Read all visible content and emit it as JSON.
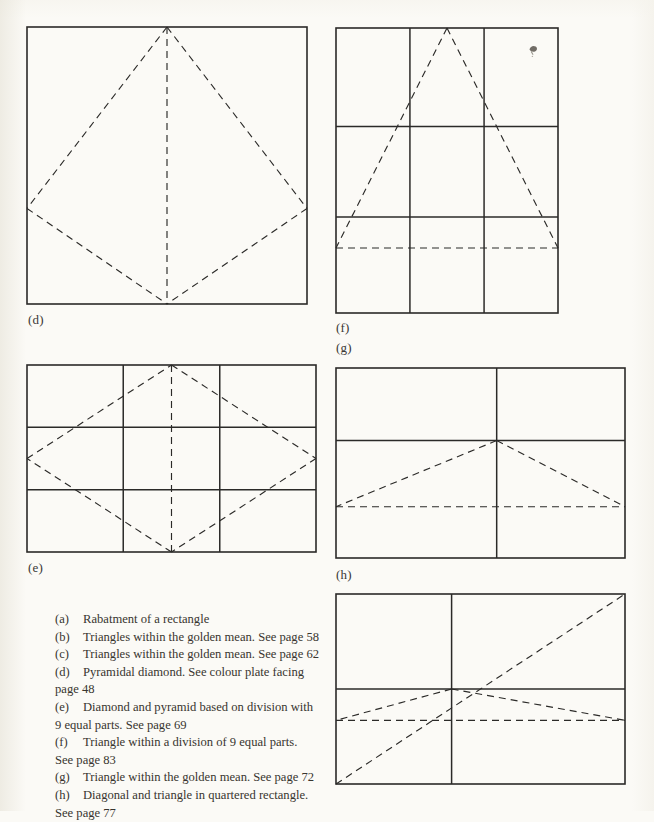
{
  "page": {
    "background_color": "#fbfaf6",
    "ink_color": "#2b2a28",
    "width": 654,
    "height": 811
  },
  "figures": [
    {
      "id": "d",
      "label": "(d)",
      "description": "Pyramidal diamond inscribed in a square",
      "frame": {
        "x": 27,
        "y": 27,
        "w": 280,
        "h": 277
      },
      "label_pos": {
        "x": 28,
        "y": 312
      },
      "solid_lines": [],
      "dashed_lines": [
        {
          "name": "apex-to-left",
          "x1": 0.5,
          "y1": 0.0,
          "x2": 0.0,
          "y2": 0.655
        },
        {
          "name": "apex-to-right",
          "x1": 0.5,
          "y1": 0.0,
          "x2": 1.0,
          "y2": 0.655
        },
        {
          "name": "left-to-base",
          "x1": 0.0,
          "y1": 0.655,
          "x2": 0.5,
          "y2": 1.0
        },
        {
          "name": "right-to-base",
          "x1": 1.0,
          "y1": 0.655,
          "x2": 0.5,
          "y2": 1.0
        },
        {
          "name": "vertical-axis",
          "x1": 0.5,
          "y1": 0.0,
          "x2": 0.5,
          "y2": 1.0
        }
      ]
    },
    {
      "id": "f",
      "label": "(f)",
      "description": "Triangle within a division of 9 equal parts",
      "frame": {
        "x": 336,
        "y": 28,
        "w": 222,
        "h": 285
      },
      "label_pos": {
        "x": 336,
        "y": 320
      },
      "solid_lines": [
        {
          "name": "vertical-third-1",
          "x1": 0.333,
          "y1": 0.0,
          "x2": 0.333,
          "y2": 1.0
        },
        {
          "name": "vertical-third-2",
          "x1": 0.667,
          "y1": 0.0,
          "x2": 0.667,
          "y2": 1.0
        },
        {
          "name": "horizontal-upper",
          "x1": 0.0,
          "y1": 0.346,
          "x2": 1.0,
          "y2": 0.346
        },
        {
          "name": "horizontal-lower",
          "x1": 0.0,
          "y1": 0.663,
          "x2": 1.0,
          "y2": 0.663
        }
      ],
      "dashed_lines": [
        {
          "name": "apex-to-bottom-left",
          "x1": 0.5,
          "y1": 0.0,
          "x2": 0.0,
          "y2": 0.772
        },
        {
          "name": "apex-to-bottom-right",
          "x1": 0.5,
          "y1": 0.0,
          "x2": 1.0,
          "y2": 0.772
        },
        {
          "name": "triangle-base",
          "x1": 0.0,
          "y1": 0.772,
          "x2": 1.0,
          "y2": 0.772
        }
      ]
    },
    {
      "id": "g-label-only",
      "label": "(g)",
      "label_pos": {
        "x": 336,
        "y": 340
      }
    },
    {
      "id": "e",
      "label": "(e)",
      "description": "Diamond and pyramid based on division with 9 equal parts",
      "frame": {
        "x": 27,
        "y": 365,
        "w": 289,
        "h": 187
      },
      "label_pos": {
        "x": 28,
        "y": 560
      },
      "solid_lines": [
        {
          "name": "vertical-third-1",
          "x1": 0.333,
          "y1": 0.0,
          "x2": 0.333,
          "y2": 1.0
        },
        {
          "name": "vertical-third-2",
          "x1": 0.667,
          "y1": 0.0,
          "x2": 0.667,
          "y2": 1.0
        },
        {
          "name": "horizontal-third-1",
          "x1": 0.0,
          "y1": 0.333,
          "x2": 1.0,
          "y2": 0.333
        },
        {
          "name": "horizontal-third-2",
          "x1": 0.0,
          "y1": 0.667,
          "x2": 1.0,
          "y2": 0.667
        }
      ],
      "dashed_lines": [
        {
          "name": "top-to-right",
          "x1": 0.5,
          "y1": 0.0,
          "x2": 1.0,
          "y2": 0.5
        },
        {
          "name": "right-to-bottom",
          "x1": 1.0,
          "y1": 0.5,
          "x2": 0.5,
          "y2": 1.0
        },
        {
          "name": "bottom-to-left",
          "x1": 0.5,
          "y1": 1.0,
          "x2": 0.0,
          "y2": 0.5
        },
        {
          "name": "left-to-top",
          "x1": 0.0,
          "y1": 0.5,
          "x2": 0.5,
          "y2": 0.0
        },
        {
          "name": "vertical-axis",
          "x1": 0.5,
          "y1": 0.0,
          "x2": 0.5,
          "y2": 1.0
        }
      ]
    },
    {
      "id": "g",
      "label": "(h)",
      "description": "Triangle within the golden mean",
      "frame": {
        "x": 336,
        "y": 368,
        "w": 289,
        "h": 190
      },
      "label_pos": {
        "x": 336,
        "y": 567
      },
      "solid_lines": [
        {
          "name": "vertical-golden",
          "x1": 0.556,
          "y1": 0.0,
          "x2": 0.556,
          "y2": 1.0
        },
        {
          "name": "horizontal-golden",
          "x1": 0.0,
          "y1": 0.382,
          "x2": 1.0,
          "y2": 0.382
        }
      ],
      "dashed_lines": [
        {
          "name": "apex-to-left-base",
          "x1": 0.556,
          "y1": 0.382,
          "x2": 0.0,
          "y2": 0.73
        },
        {
          "name": "apex-to-right-base",
          "x1": 0.556,
          "y1": 0.382,
          "x2": 1.0,
          "y2": 0.73
        },
        {
          "name": "triangle-base",
          "x1": 0.0,
          "y1": 0.73,
          "x2": 1.0,
          "y2": 0.73
        }
      ]
    },
    {
      "id": "h",
      "label": "",
      "description": "Diagonal and triangle in quartered rectangle",
      "frame": {
        "x": 336,
        "y": 594,
        "w": 289,
        "h": 190
      },
      "label_pos": null,
      "solid_lines": [
        {
          "name": "vertical-quarter",
          "x1": 0.4,
          "y1": 0.0,
          "x2": 0.4,
          "y2": 1.0
        },
        {
          "name": "horizontal-quarter",
          "x1": 0.0,
          "y1": 0.5,
          "x2": 1.0,
          "y2": 0.5
        }
      ],
      "dashed_lines": [
        {
          "name": "diagonal-bottom-left-to-top-right",
          "x1": 0.0,
          "y1": 1.0,
          "x2": 1.0,
          "y2": 0.0
        },
        {
          "name": "apex-to-left-base",
          "x1": 0.4,
          "y1": 0.5,
          "x2": 0.0,
          "y2": 0.665
        },
        {
          "name": "apex-to-right-base",
          "x1": 0.4,
          "y1": 0.5,
          "x2": 1.0,
          "y2": 0.665
        },
        {
          "name": "triangle-base",
          "x1": 0.0,
          "y1": 0.665,
          "x2": 1.0,
          "y2": 0.665
        }
      ]
    }
  ],
  "artifacts": [
    {
      "name": "ink-smudge",
      "x": 527,
      "y": 44,
      "w": 11,
      "h": 12
    }
  ],
  "caption": {
    "entries": [
      {
        "key": "(a)",
        "text": "Rabatment of a rectangle",
        "continuation": null
      },
      {
        "key": "(b)",
        "text": "Triangles within the golden mean. See page 58",
        "continuation": null
      },
      {
        "key": "(c)",
        "text": "Triangles within the golden mean. See page 62",
        "continuation": null
      },
      {
        "key": "(d)",
        "text": "Pyramidal diamond. See colour plate facing",
        "continuation": "page 48"
      },
      {
        "key": "(e)",
        "text": "Diamond and pyramid based on division with",
        "continuation": "9 equal parts. See page 69"
      },
      {
        "key": "(f)",
        "text": "Triangle within a division of 9 equal parts.",
        "continuation": "See page 83"
      },
      {
        "key": "(g)",
        "text": "Triangle within the golden mean. See page 72",
        "continuation": null
      },
      {
        "key": "(h)",
        "text": "Diagonal and triangle in quartered rectangle.",
        "continuation": "See page 77"
      }
    ]
  }
}
